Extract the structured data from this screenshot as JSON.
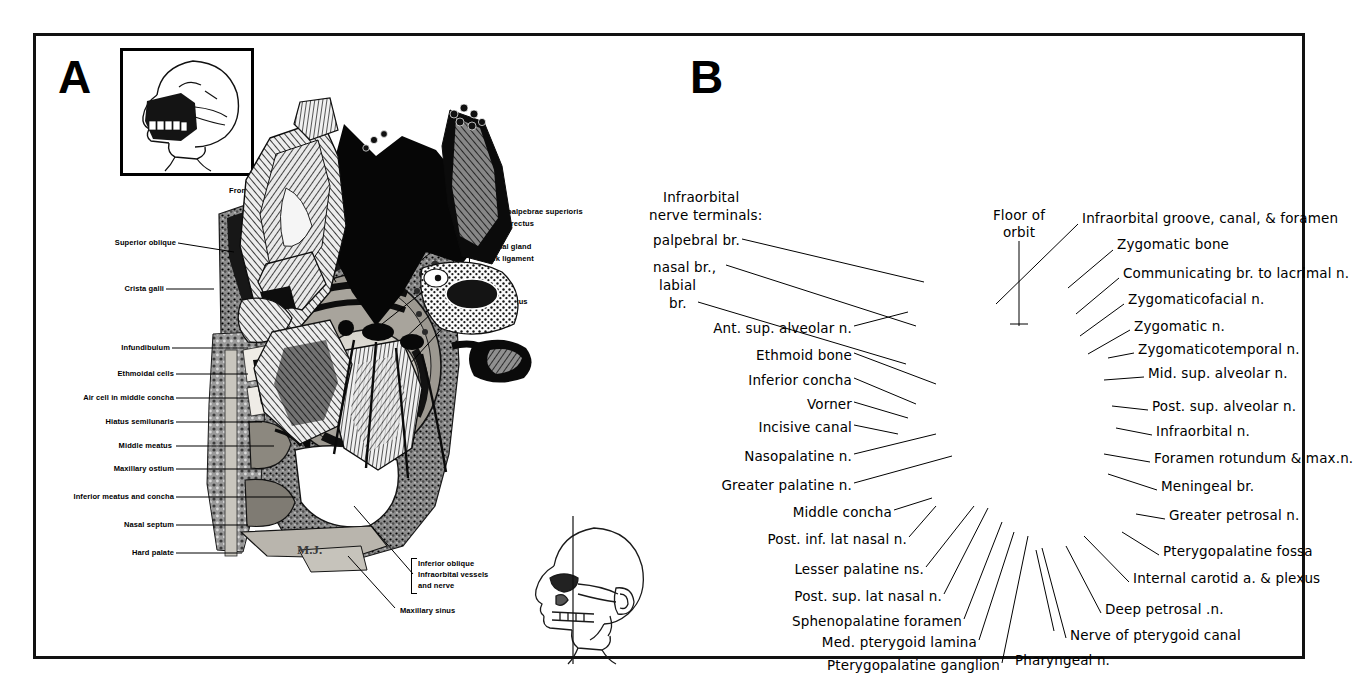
{
  "figure": {
    "panel_a": {
      "letter": "A",
      "signature": "M.J.",
      "labels_left": [
        {
          "text": "Superior oblique",
          "x": 63,
          "y": 207
        },
        {
          "text": "Crista galli",
          "x": 88,
          "y": 253
        },
        {
          "text": "Infundibulum",
          "x": 84,
          "y": 312
        },
        {
          "text": "Ethmoidal cells",
          "x": 73,
          "y": 338
        },
        {
          "text": "Air cell in middle concha",
          "x": 22,
          "y": 362
        },
        {
          "text": "Hiatus semilunaris",
          "x": 58,
          "y": 386
        },
        {
          "text": "Middle meatus",
          "x": 76,
          "y": 410
        },
        {
          "text": "Maxillary ostium",
          "x": 68,
          "y": 433
        },
        {
          "text": "Inferior meatus and concha",
          "x": 16,
          "y": 461
        },
        {
          "text": "Nasal septum",
          "x": 79,
          "y": 489
        },
        {
          "text": "Hard palate",
          "x": 86,
          "y": 517
        }
      ],
      "labels_top": [
        {
          "text": "Frontal sinus",
          "x": 193,
          "y": 155
        },
        {
          "text": "Supraorbital artery and nerve",
          "x": 318,
          "y": 130
        }
      ],
      "labels_right": [
        {
          "text": "Levator palpebrae superioris",
          "x": 440,
          "y": 176
        },
        {
          "text": "Superior rectus",
          "x": 440,
          "y": 188
        },
        {
          "text": "Lacrimal gland",
          "x": 440,
          "y": 211
        },
        {
          "text": "Check ligament",
          "x": 440,
          "y": 223
        },
        {
          "text": "Eyeball",
          "x": 440,
          "y": 244
        },
        {
          "text": "Lateral rectus",
          "x": 440,
          "y": 265
        }
      ],
      "labels_lower_right": [
        {
          "text": "Inferior oblique",
          "x": 381,
          "y": 528
        },
        {
          "text": "Infraorbital vessels",
          "x": 381,
          "y": 539
        },
        {
          "text": "and nerve",
          "x": 381,
          "y": 550
        },
        {
          "text": "Maxillary sinus",
          "x": 363,
          "y": 575
        }
      ]
    },
    "panel_b": {
      "letter": "B",
      "labels_top_left": [
        {
          "text": "Infraorbital",
          "x": 627,
          "y": 162
        },
        {
          "text": "nerve terminals:",
          "x": 613,
          "y": 180
        },
        {
          "text": "palpebral br.",
          "x": 617,
          "y": 205
        },
        {
          "text": "nasal br.,",
          "x": 617,
          "y": 232
        },
        {
          "text": "labial",
          "x": 623,
          "y": 250
        },
        {
          "text": "br.",
          "x": 632,
          "y": 268
        }
      ],
      "label_floor_of_orbit": [
        {
          "text": "Floor of",
          "x": 955,
          "y": 180
        },
        {
          "text": "orbit",
          "x": 966,
          "y": 197
        }
      ],
      "labels_left": [
        {
          "text": "Ant. sup. alveolar n.",
          "x": 815,
          "y": 293
        },
        {
          "text": "Ethmoid bone",
          "x": 815,
          "y": 320
        },
        {
          "text": "Inferior concha",
          "x": 815,
          "y": 345
        },
        {
          "text": "Vorner",
          "x": 815,
          "y": 369
        },
        {
          "text": "Incisive canal",
          "x": 815,
          "y": 392
        },
        {
          "text": "Nasopalatine n.",
          "x": 815,
          "y": 421
        },
        {
          "text": "Greater palatine n.",
          "x": 815,
          "y": 450
        },
        {
          "text": "Middle concha",
          "x": 855,
          "y": 477
        },
        {
          "text": "Post. inf. lat nasal n.",
          "x": 870,
          "y": 504
        },
        {
          "text": "Lesser palatine ns.",
          "x": 887,
          "y": 534
        },
        {
          "text": "Post. sup. lat nasal n.",
          "x": 905,
          "y": 561
        },
        {
          "text": "Sphenopalatine foramen",
          "x": 925,
          "y": 586
        },
        {
          "text": "Med. pterygoid lamina",
          "x": 940,
          "y": 607
        },
        {
          "text": "Pterygopalatine ganglion",
          "x": 963,
          "y": 630
        }
      ],
      "labels_right": [
        {
          "text": "Infraorbital groove, canal, & foramen",
          "x": 1046,
          "y": 183
        },
        {
          "text": "Zygomatic bone",
          "x": 1081,
          "y": 209
        },
        {
          "text": "Communicating br. to lacrimal n.",
          "x": 1087,
          "y": 238
        },
        {
          "text": "Zygomaticofacial n.",
          "x": 1092,
          "y": 264
        },
        {
          "text": "Zygomatic n.",
          "x": 1098,
          "y": 291
        },
        {
          "text": "Zygomaticotemporal n.",
          "x": 1102,
          "y": 314
        },
        {
          "text": "Mid. sup. alveolar n.",
          "x": 1112,
          "y": 338
        },
        {
          "text": "Post. sup. alveolar n.",
          "x": 1116,
          "y": 371
        },
        {
          "text": "Infraorbital n.",
          "x": 1120,
          "y": 396
        },
        {
          "text": "Foramen rotundum & max.n.",
          "x": 1118,
          "y": 423
        },
        {
          "text": "Meningeal br.",
          "x": 1125,
          "y": 451
        },
        {
          "text": "Greater petrosal n.",
          "x": 1133,
          "y": 480
        },
        {
          "text": "Pterygopalatine fossa",
          "x": 1127,
          "y": 516
        },
        {
          "text": "Internal carotid a. & plexus",
          "x": 1097,
          "y": 543
        },
        {
          "text": "Deep petrosal .n.",
          "x": 1069,
          "y": 574
        },
        {
          "text": "Nerve of pterygoid canal",
          "x": 1034,
          "y": 600
        },
        {
          "text": "Pharyngeal n.",
          "x": 979,
          "y": 625
        }
      ]
    }
  }
}
